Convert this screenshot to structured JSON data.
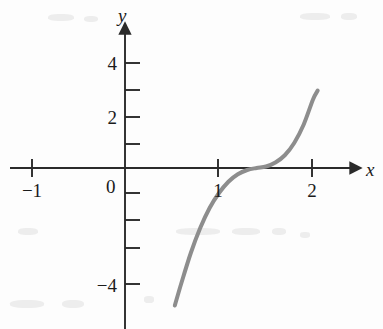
{
  "figure": {
    "background_color": "#fdfdfd",
    "axis_color": "#2a2a2a",
    "curve_color": "#8d8d8d",
    "label_color": "#1b1b1b"
  },
  "axes": {
    "x_axis_label": "x",
    "y_axis_label": "y",
    "origin_label": "0"
  },
  "chart_data": {
    "type": "line",
    "title": "",
    "subtitle": "",
    "xlabel": "x",
    "ylabel": "y",
    "legend": [],
    "legend_position": "none",
    "grid": false,
    "xlim": [
      -1.25,
      2.35
    ],
    "ylim": [
      -6.4,
      4.8
    ],
    "x_ticks": [
      -1,
      1,
      2
    ],
    "x_tick_labels": [
      "−1",
      "1",
      "2"
    ],
    "x_minor_ticks": [],
    "y_ticks": [
      4,
      2,
      -4
    ],
    "y_tick_labels": [
      "4",
      "2",
      "−4"
    ],
    "y_minor_ticks": [
      3,
      1,
      -1,
      -2,
      -3,
      -5
    ],
    "origin_label": "0",
    "series": [
      {
        "name": "y = (x − 1)³",
        "equation": "y = (x - 1)^3",
        "color": "#8d8d8d",
        "line_width": 4,
        "x": [
          0.53,
          0.6,
          0.7,
          0.8,
          0.9,
          1.0,
          1.1,
          1.2,
          1.3,
          1.4,
          1.5,
          1.6,
          1.7,
          1.8,
          1.9,
          2.0,
          2.05
        ],
        "y": [
          -5.5,
          -4.6,
          -3.4,
          -2.4,
          -1.6,
          -1.0,
          -0.55,
          -0.25,
          -0.08,
          0.0,
          0.06,
          0.22,
          0.51,
          1.0,
          1.73,
          2.74,
          3.1
        ],
        "key_points": [
          {
            "x": 0,
            "y": -1,
            "note": "y-intercept"
          },
          {
            "x": 1,
            "y": 0,
            "note": "x-intercept / inflection"
          },
          {
            "x": 2.05,
            "y": 3.1,
            "note": "upper endpoint"
          },
          {
            "x": 0.53,
            "y": -5.5,
            "note": "lower endpoint"
          }
        ]
      }
    ]
  }
}
